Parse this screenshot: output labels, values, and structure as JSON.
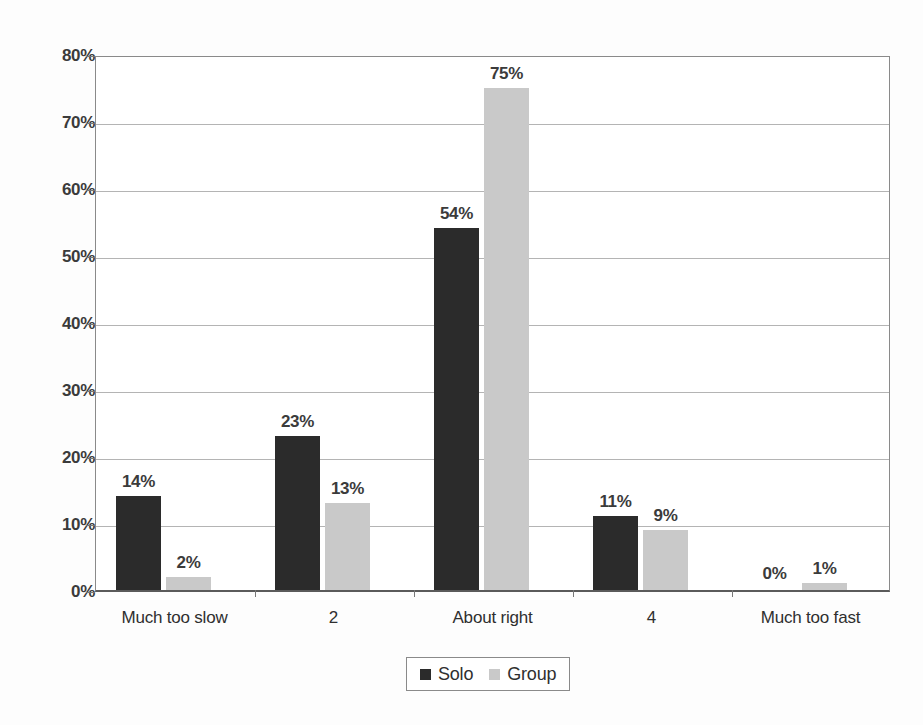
{
  "chart_data": {
    "type": "bar",
    "title": "",
    "xlabel": "",
    "ylabel": "",
    "categories": [
      "Much too slow",
      "2",
      "About right",
      "4",
      "Much too fast"
    ],
    "series": [
      {
        "name": "Solo",
        "color": "#2b2b2b",
        "values": [
          14,
          23,
          54,
          11,
          0
        ],
        "labels": [
          "14%",
          "23%",
          "54%",
          "11%",
          "0%"
        ]
      },
      {
        "name": "Group",
        "color": "#c9c9c9",
        "values": [
          2,
          13,
          75,
          9,
          1
        ],
        "labels": [
          "2%",
          "13%",
          "75%",
          "9%",
          "1%"
        ]
      }
    ],
    "ylim": [
      0,
      80
    ],
    "yticks": [
      0,
      10,
      20,
      30,
      40,
      50,
      60,
      70,
      80
    ],
    "ytick_labels": [
      "0%",
      "10%",
      "20%",
      "30%",
      "40%",
      "50%",
      "60%",
      "70%",
      "80%"
    ],
    "grid": true,
    "legend_position": "bottom-center",
    "value_labels": true
  },
  "legend": {
    "entries": [
      {
        "label": "Solo"
      },
      {
        "label": "Group"
      }
    ]
  }
}
